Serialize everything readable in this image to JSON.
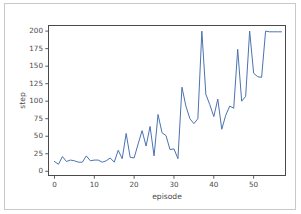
{
  "figure": {
    "background_color": "#ffffff",
    "border_color": "#c9c9c9",
    "axes_color": "#4a4a4a"
  },
  "chart_data": {
    "type": "line",
    "title": "",
    "xlabel": "episode",
    "ylabel": "step",
    "xlim": [
      -1.5,
      58
    ],
    "ylim": [
      -6,
      208
    ],
    "xticks": [
      0,
      10,
      20,
      30,
      40,
      50
    ],
    "xticklabels": [
      "0",
      "10",
      "20",
      "30",
      "40",
      "50"
    ],
    "yticks": [
      0,
      25,
      50,
      75,
      100,
      125,
      150,
      175,
      200
    ],
    "yticklabels": [
      "0",
      "25",
      "50",
      "75",
      "100",
      "125",
      "150",
      "175",
      "200"
    ],
    "grid": false,
    "legend": null,
    "line_color": "#4c72b0",
    "line_width": 1.0,
    "series": [
      {
        "name": "step",
        "x": [
          0,
          1,
          2,
          3,
          4,
          5,
          6,
          7,
          8,
          9,
          10,
          11,
          12,
          13,
          14,
          15,
          16,
          17,
          18,
          19,
          20,
          21,
          22,
          23,
          24,
          25,
          26,
          27,
          28,
          29,
          30,
          31,
          32,
          33,
          34,
          35,
          36,
          37,
          38,
          39,
          40,
          41,
          42,
          43,
          44,
          45,
          46,
          47,
          48,
          49,
          50,
          51,
          52,
          53,
          54,
          55,
          56,
          57
        ],
        "values": [
          14,
          10,
          21,
          14,
          16,
          15,
          13,
          13,
          22,
          15,
          16,
          16,
          13,
          15,
          19,
          13,
          30,
          18,
          54,
          20,
          19,
          39,
          58,
          36,
          64,
          22,
          81,
          55,
          51,
          31,
          32,
          18,
          120,
          93,
          75,
          68,
          75,
          200,
          110,
          95,
          78,
          103,
          60,
          80,
          93,
          90,
          174,
          100,
          107,
          200,
          140,
          135,
          134,
          200,
          199,
          199,
          199,
          199
        ]
      }
    ]
  },
  "axes": {
    "ylabel_rotation": "-90",
    "tick_direction": "out"
  }
}
